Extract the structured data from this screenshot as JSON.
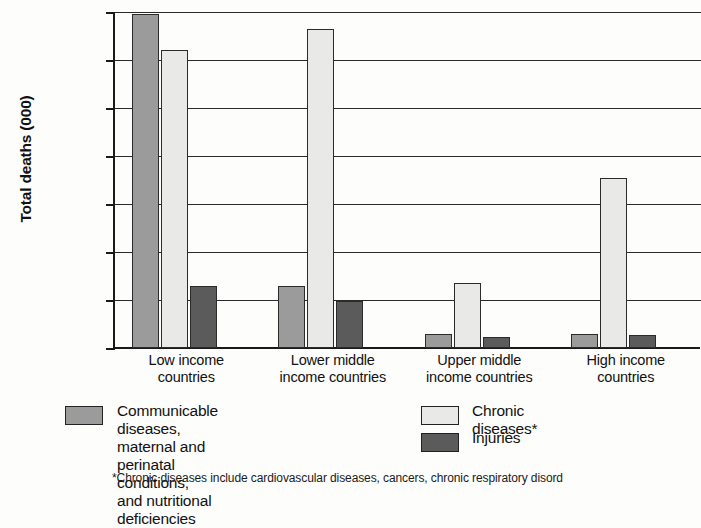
{
  "chart_data": {
    "type": "bar",
    "title": "",
    "xlabel": "",
    "ylabel": "Total deaths (000)",
    "ylim": [
      0,
      14000
    ],
    "ytick_labels": [
      "14,000",
      "12,000",
      "10,000",
      "8,000",
      "6,000",
      "4,000",
      "2,000",
      "0"
    ],
    "ytick_values": [
      14000,
      12000,
      10000,
      8000,
      6000,
      4000,
      2000,
      0
    ],
    "grid": true,
    "legend_position": "below",
    "categories": [
      "Low income\ncountries",
      "Lower middle\nincome countries",
      "Upper middle\nincome countries",
      "High income\ncountries"
    ],
    "series": [
      {
        "name": "Communicable diseases,\nmaternal and perinatal conditions,\nand nutritional deficiencies",
        "color": "#9b9b9b",
        "values": [
          13900,
          2600,
          600,
          600
        ]
      },
      {
        "name": "Chronic diseases*",
        "color": "#e9e9e7",
        "values": [
          12400,
          13300,
          2700,
          7100
        ]
      },
      {
        "name": "Injuries",
        "color": "#5b5b5b",
        "values": [
          2600,
          1950,
          450,
          550
        ]
      }
    ],
    "footnote": "*Chronic diseases include cardiovascular diseases, cancers, chronic respiratory disord"
  }
}
